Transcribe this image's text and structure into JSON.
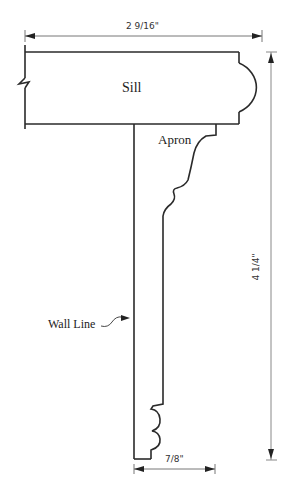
{
  "drawing": {
    "title": "Window sill and apron profile",
    "labels": {
      "sill": "Sill",
      "apron": "Apron",
      "wall_line": "Wall Line"
    },
    "dimensions": {
      "overall_width": "2 9/16\"",
      "overall_height": "4 1/4\"",
      "apron_thickness": "7/8\""
    },
    "colors": {
      "profile_line": "#2a2a2a",
      "dimension_line": "#888888",
      "background": "#ffffff"
    }
  }
}
